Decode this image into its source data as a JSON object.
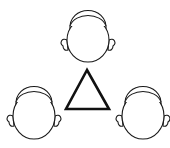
{
  "diagram": {
    "colors": {
      "stroke": "#1a1a1a",
      "background": "#ffffff"
    },
    "heads": [
      {
        "position": "top",
        "cx": 88,
        "cy": 40,
        "rx": 21,
        "ry": 22
      },
      {
        "position": "bottom-left",
        "cx": 34,
        "cy": 116,
        "rx": 21,
        "ry": 23
      },
      {
        "position": "bottom-right",
        "cx": 143,
        "cy": 116,
        "rx": 21,
        "ry": 23
      }
    ],
    "center_shape": {
      "type": "triangle-icon",
      "points": [
        [
          87,
          70
        ],
        [
          66,
          109
        ],
        [
          109,
          109
        ]
      ]
    }
  }
}
